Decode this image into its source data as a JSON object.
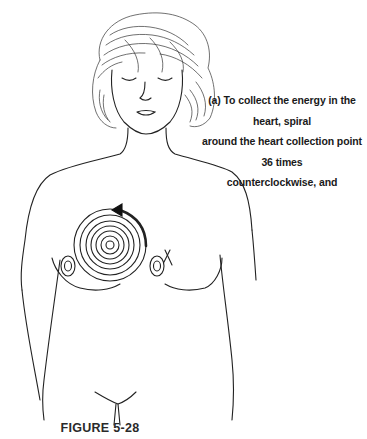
{
  "instruction": {
    "lines": [
      "(a) To collect the energy in the heart, spiral",
      "around the heart collection point 36 times",
      "counterclockwise, and"
    ]
  },
  "figure": {
    "label": "FIGURE 5-28",
    "spiral_direction": "counterclockwise",
    "repetitions": 36
  },
  "colors": {
    "ink": "#222222",
    "background": "#ffffff"
  }
}
